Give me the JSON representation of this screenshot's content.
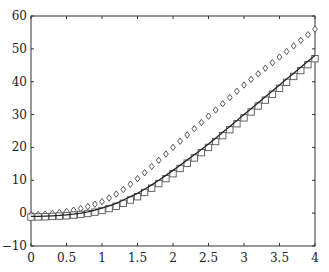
{
  "chart_data": {
    "type": "line",
    "title": "",
    "xlabel": "",
    "ylabel": "",
    "xlim": [
      0,
      4
    ],
    "ylim": [
      -10,
      60
    ],
    "grid": false,
    "legend": null,
    "x_ticks": [
      "0",
      "0.5",
      "1",
      "1.5",
      "2",
      "2.5",
      "3",
      "3.5",
      "4"
    ],
    "y_ticks": [
      "-10",
      "0",
      "10",
      "20",
      "30",
      "40",
      "50",
      "60"
    ],
    "x": [
      0,
      0.1,
      0.2,
      0.3,
      0.4,
      0.5,
      0.6,
      0.7,
      0.8,
      0.9,
      1.0,
      1.1,
      1.2,
      1.3,
      1.4,
      1.5,
      1.6,
      1.7,
      1.8,
      1.9,
      2.0,
      2.1,
      2.2,
      2.3,
      2.4,
      2.5,
      2.6,
      2.7,
      2.8,
      2.9,
      3.0,
      3.1,
      3.2,
      3.3,
      3.4,
      3.5,
      3.6,
      3.7,
      3.8,
      3.9,
      4.0
    ],
    "series": [
      {
        "name": "curve",
        "style": "solid-line",
        "color": "#222222",
        "values": [
          -1.0,
          -0.95,
          -0.9,
          -0.8,
          -0.7,
          -0.5,
          -0.3,
          0.0,
          0.4,
          0.9,
          1.5,
          2.2,
          3.0,
          4.0,
          5.0,
          6.0,
          7.3,
          8.6,
          10.0,
          11.5,
          13.0,
          14.6,
          16.2,
          17.8,
          19.4,
          21.0,
          22.8,
          24.6,
          26.4,
          28.2,
          30.0,
          31.8,
          33.6,
          35.4,
          37.2,
          39.0,
          40.8,
          42.6,
          44.4,
          46.2,
          48.0
        ]
      },
      {
        "name": "diamonds",
        "style": "diamond-marker",
        "color": "#444444",
        "values": [
          -0.5,
          -0.4,
          -0.3,
          -0.1,
          0.2,
          0.5,
          0.9,
          1.4,
          2.0,
          2.7,
          3.5,
          4.6,
          5.8,
          7.2,
          8.8,
          10.5,
          12.3,
          14.2,
          16.1,
          18.0,
          20.0,
          21.9,
          23.8,
          25.7,
          27.6,
          29.5,
          31.4,
          33.3,
          35.2,
          37.1,
          39.0,
          40.7,
          42.4,
          44.1,
          45.8,
          47.5,
          49.2,
          50.9,
          52.6,
          54.3,
          56.0
        ]
      },
      {
        "name": "squares",
        "style": "square-marker",
        "color": "#555555",
        "values": [
          -1.2,
          -1.15,
          -1.1,
          -1.0,
          -0.9,
          -0.8,
          -0.6,
          -0.4,
          -0.1,
          0.3,
          0.8,
          1.4,
          2.1,
          3.0,
          4.0,
          5.0,
          6.3,
          7.6,
          9.0,
          10.5,
          12.0,
          13.6,
          15.2,
          16.8,
          18.4,
          20.0,
          21.8,
          23.6,
          25.4,
          27.2,
          29.0,
          30.8,
          32.6,
          34.4,
          36.2,
          38.0,
          39.8,
          41.6,
          43.4,
          45.2,
          47.0
        ]
      }
    ]
  }
}
